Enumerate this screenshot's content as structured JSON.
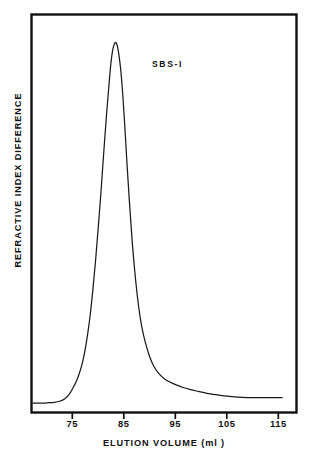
{
  "chart_data": {
    "type": "line",
    "title": "",
    "subtitle": "",
    "xlabel": "ELUTION VOLUME (ml )",
    "ylabel": "REFRACTIVE INDEX DIFFERENCE",
    "annotations": [
      {
        "text": "SBS-I",
        "x": 91.5,
        "y_frac": 0.88
      }
    ],
    "legend": [],
    "legend_position": "none",
    "grid": false,
    "xlim": [
      70.2,
      120.2
    ],
    "ylim": [
      0,
      1
    ],
    "xticks": [
      75,
      85,
      95,
      105,
      115
    ],
    "xtick_labels": [
      "75",
      "85",
      "95",
      "105",
      "115"
    ],
    "yticks": [],
    "ytick_labels": [],
    "series": [
      {
        "name": "SBS-I",
        "color": "#1a1a1a",
        "x": [
          70.2,
          71.5,
          72.5,
          73.5,
          74.5,
          75.5,
          76.5,
          77.3,
          78.0,
          78.6,
          79.2,
          79.8,
          80.3,
          80.8,
          81.3,
          81.8,
          82.3,
          82.8,
          83.3,
          83.8,
          84.3,
          84.8,
          85.2,
          85.6,
          86.0,
          86.3,
          86.6,
          87.0,
          87.4,
          87.8,
          88.2,
          88.7,
          89.2,
          89.8,
          90.4,
          91.0,
          91.7,
          92.5,
          93.3,
          94.2,
          95.2,
          96.3,
          97.5,
          98.8,
          100.2,
          101.7,
          103.3,
          105.0,
          106.5,
          108.0,
          110.0,
          112.0,
          114.0,
          116.0,
          117.5
        ],
        "y": [
          0.004,
          0.004,
          0.004,
          0.005,
          0.006,
          0.009,
          0.016,
          0.028,
          0.045,
          0.062,
          0.085,
          0.115,
          0.15,
          0.195,
          0.25,
          0.32,
          0.4,
          0.49,
          0.585,
          0.69,
          0.79,
          0.88,
          0.945,
          0.985,
          1.0,
          0.995,
          0.975,
          0.93,
          0.86,
          0.77,
          0.67,
          0.555,
          0.45,
          0.35,
          0.272,
          0.215,
          0.17,
          0.132,
          0.105,
          0.086,
          0.072,
          0.062,
          0.054,
          0.047,
          0.041,
          0.036,
          0.031,
          0.027,
          0.024,
          0.022,
          0.02,
          0.019,
          0.019,
          0.019,
          0.019
        ]
      }
    ]
  },
  "axes": {
    "xlabel": "ELUTION VOLUME (ml )",
    "ylabel": "REFRACTIVE INDEX DIFFERENCE",
    "xtick_labels": [
      "75",
      "85",
      "95",
      "105",
      "115"
    ]
  },
  "annotation": {
    "sample_label": "SBS-I"
  },
  "style": {
    "line_color": "#1a1a1a",
    "frame_color": "#111111",
    "background": "#ffffff"
  }
}
